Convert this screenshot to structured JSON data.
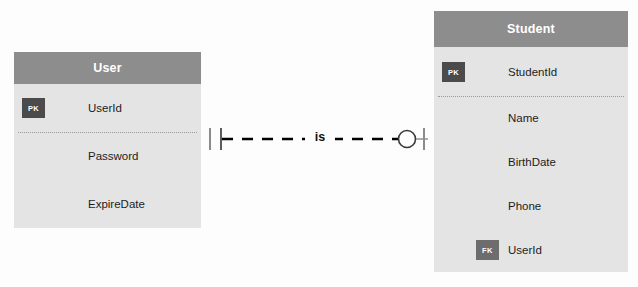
{
  "diagram": {
    "type": "entity-relationship-diagram",
    "notation": "crow-foot",
    "background_color": "#fdfdfd"
  },
  "colors": {
    "header_fill": "#8d8d8d",
    "header_text": "#ffffff",
    "body_fill": "#e4e4e4",
    "attribute_text": "#1d1d1d",
    "pk_badge_fill": "#4b4b4b",
    "fk_badge_fill": "#6d6d6d",
    "badge_text": "#ffffff",
    "connector_line": "#000000",
    "divider_line": "#9b9b9b"
  },
  "entities": [
    {
      "id": "user",
      "title": "User",
      "attributes": [
        {
          "key": "PK",
          "name": "UserId"
        },
        {
          "key": "",
          "name": "Password"
        },
        {
          "key": "",
          "name": "ExpireDate"
        }
      ],
      "pk_divider_after_index": 0
    },
    {
      "id": "student",
      "title": "Student",
      "attributes": [
        {
          "key": "PK",
          "name": "StudentId"
        },
        {
          "key": "",
          "name": "Name"
        },
        {
          "key": "",
          "name": "BirthDate"
        },
        {
          "key": "",
          "name": "Phone"
        },
        {
          "key": "FK",
          "name": "UserId"
        }
      ],
      "pk_divider_after_index": 0
    }
  ],
  "relationship": {
    "label": "is",
    "line_style": "dashed",
    "from_entity": "User",
    "to_entity": "Student",
    "from_cardinality": "one-and-only-one",
    "to_cardinality": "zero-or-one"
  }
}
